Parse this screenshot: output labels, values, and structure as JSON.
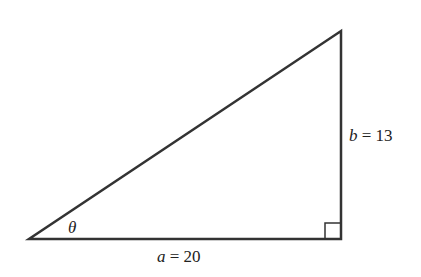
{
  "diagram": {
    "type": "right-triangle",
    "stroke_color": "#333333",
    "vertices": {
      "left": [
        29,
        239
      ],
      "right_angle": [
        341,
        239
      ],
      "top": [
        341,
        31
      ]
    },
    "angle_label": {
      "symbol": "θ"
    },
    "base_label": {
      "var": "a",
      "eq": " = ",
      "value": "20"
    },
    "height_label": {
      "var": "b",
      "eq": " = ",
      "value": "13"
    },
    "right_angle_marker": true
  }
}
